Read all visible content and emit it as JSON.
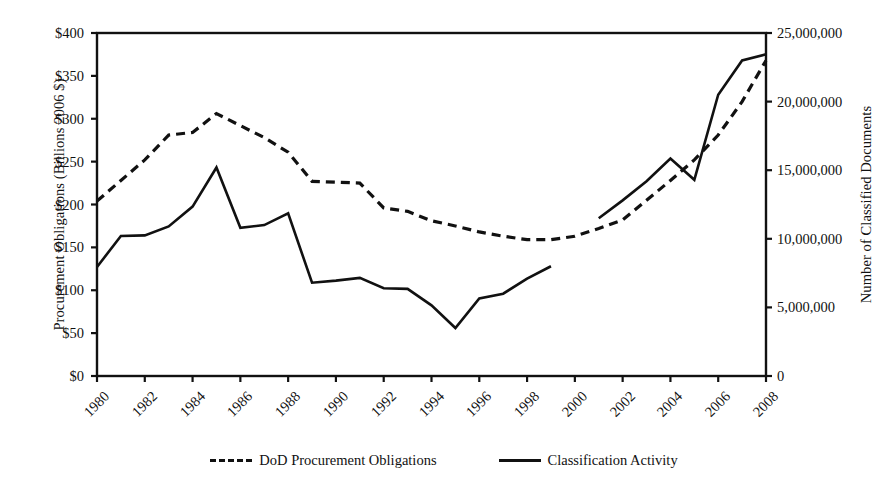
{
  "chart_data": {
    "type": "line",
    "title": "",
    "xlabel": "",
    "ylabel": "Procurement Obligations (Billions 2006 $)",
    "y2label": "Number of Classified Documents",
    "grid": false,
    "legend_position": "bottom",
    "xlim": [
      1980,
      2008
    ],
    "ylim": [
      0,
      400
    ],
    "y2lim": [
      0,
      25000000
    ],
    "x": [
      1980,
      1981,
      1982,
      1983,
      1984,
      1985,
      1986,
      1987,
      1988,
      1989,
      1990,
      1991,
      1992,
      1993,
      1994,
      1995,
      1996,
      1997,
      1998,
      1999,
      2000,
      2001,
      2002,
      2003,
      2004,
      2005,
      2006,
      2007,
      2008
    ],
    "xticks": [
      "1980",
      "1982",
      "1984",
      "1986",
      "1988",
      "1990",
      "1992",
      "1994",
      "1996",
      "1998",
      "2000",
      "2002",
      "2004",
      "2006",
      "2008"
    ],
    "yticks": [
      "$0",
      "$50",
      "$100",
      "$150",
      "$200",
      "$250",
      "$300",
      "$350",
      "$400"
    ],
    "y2ticks": [
      "0",
      "5,000,000",
      "10,000,000",
      "15,000,000",
      "20,000,000",
      "25,000,000"
    ],
    "series": [
      {
        "name": "DoD Procurement Obligations",
        "axis": "left",
        "style": "dashed",
        "units": "Billions 2006 $",
        "x": [
          1980,
          1981,
          1982,
          1983,
          1984,
          1985,
          1986,
          1987,
          1988,
          1989,
          1990,
          1991,
          1992,
          1993,
          1994,
          1995,
          1996,
          1997,
          1998,
          1999,
          2000,
          2001,
          2002,
          2003,
          2004,
          2005,
          2006,
          2007,
          2008
        ],
        "values": [
          204,
          228,
          252,
          281,
          284,
          306,
          292,
          278,
          261,
          227,
          226,
          225,
          196,
          192,
          181,
          175,
          168,
          163,
          159,
          159,
          163,
          172,
          182,
          205,
          228,
          252,
          281,
          320,
          368
        ]
      },
      {
        "name": "Classification Activity",
        "axis": "right",
        "style": "solid",
        "units": "Number of Classified Documents",
        "x": [
          1980,
          1981,
          1982,
          1983,
          1984,
          1985,
          1986,
          1987,
          1988,
          1989,
          1990,
          1991,
          1992,
          1993,
          1994,
          1995,
          1996,
          1997,
          1998,
          1999,
          2001,
          2002,
          2003,
          2004,
          2005,
          2006,
          2007,
          2008
        ],
        "values": [
          7950000,
          10200000,
          10250000,
          10900000,
          12350000,
          15200000,
          10800000,
          11000000,
          11850000,
          6800000,
          6950000,
          7150000,
          6400000,
          6350000,
          5150000,
          3500000,
          5650000,
          6000000,
          7100000,
          8000000,
          11500000,
          12800000,
          14200000,
          15850000,
          14300000,
          20500000,
          23000000,
          23450000
        ],
        "gap_years": [
          2000
        ]
      }
    ]
  },
  "legend": {
    "items": [
      {
        "label": "DoD Procurement Obligations",
        "style": "dashed"
      },
      {
        "label": "Classification Activity",
        "style": "solid"
      }
    ]
  }
}
